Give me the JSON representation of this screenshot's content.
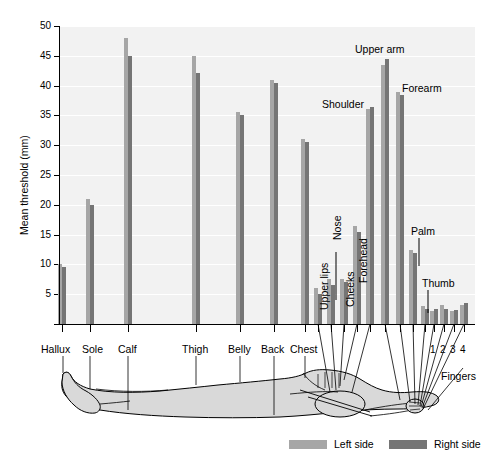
{
  "chart_data": {
    "type": "bar",
    "title": "",
    "subtitle": "",
    "xlabel": "",
    "ylabel": "Mean threshold (mm)",
    "ylim": [
      0,
      50
    ],
    "ytick_values": [
      5,
      10,
      15,
      20,
      25,
      30,
      35,
      40,
      45,
      50
    ],
    "ytick_labels": [
      "5",
      "10",
      "15",
      "20",
      "25",
      "30",
      "35",
      "40",
      "45",
      "50"
    ],
    "grid": true,
    "legend_position": "bottom",
    "categories": [
      "Hallux",
      "Sole",
      "Calf",
      "Thigh",
      "Belly",
      "Back",
      "Chest",
      "Upper lips",
      "Nose",
      "Cheeks",
      "Forehead",
      "Shoulder",
      "Upper arm",
      "Forearm",
      "Palm",
      "Thumb",
      "1",
      "2",
      "3",
      "4"
    ],
    "series": [
      {
        "name": "Left side",
        "color": "#a6a6a6",
        "values": [
          10.0,
          21.0,
          48.0,
          45.0,
          35.5,
          41.0,
          31.0,
          6.0,
          7.5,
          7.5,
          16.5,
          36.0,
          43.5,
          39.0,
          12.5,
          3.0,
          2.2,
          3.2,
          2.2,
          3.2
        ]
      },
      {
        "name": "Right side",
        "color": "#757575",
        "values": [
          9.5,
          20.0,
          45.0,
          42.2,
          35.0,
          40.5,
          30.5,
          5.0,
          6.5,
          7.0,
          15.5,
          36.5,
          44.5,
          38.5,
          12.0,
          2.6,
          2.6,
          2.6,
          2.4,
          3.6
        ]
      }
    ],
    "annotations": [
      "Upper arm",
      "Forearm",
      "Shoulder",
      "Palm",
      "Thumb",
      "Upper lips",
      "Nose",
      "Cheeks",
      "Forehead",
      "Fingers"
    ]
  },
  "yaxis": {
    "title": "Mean threshold (mm)",
    "ticks": [
      "50",
      "45",
      "40",
      "35",
      "30",
      "25",
      "20",
      "15",
      "10",
      "5"
    ]
  },
  "category_labels": {
    "hallux": "Hallux",
    "sole": "Sole",
    "calf": "Calf",
    "thigh": "Thigh",
    "belly": "Belly",
    "back": "Back",
    "chest": "Chest",
    "upper_lips": "Upper lips",
    "nose": "Nose",
    "cheeks": "Cheeks",
    "forehead": "Forehead",
    "shoulder": "Shoulder",
    "upper_arm": "Upper arm",
    "forearm": "Forearm",
    "palm": "Palm",
    "thumb": "Thumb",
    "fingers": "Fingers",
    "finger_1": "1",
    "finger_2": "2",
    "finger_3": "3",
    "finger_4": "4"
  },
  "legend": {
    "left": "Left side",
    "right": "Right side"
  },
  "colors": {
    "left_side": "#a6a6a6",
    "right_side": "#757575",
    "plot_background": "#f2f2f2",
    "gridline": "#ffffff",
    "body_fill": "#d9d9d9",
    "body_stroke": "#000000"
  }
}
